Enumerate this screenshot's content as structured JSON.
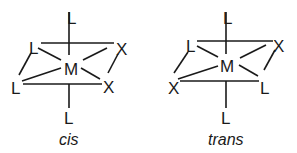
{
  "diagram": {
    "isomers": [
      {
        "id": "cis",
        "caption": "cis",
        "metal": "M",
        "ligands": {
          "axial_top": "L",
          "axial_bottom": "L",
          "back_left": "L",
          "back_right": "X",
          "front_left": "L",
          "front_right": "X"
        }
      },
      {
        "id": "trans",
        "caption": "trans",
        "metal": "M",
        "ligands": {
          "axial_top": "L",
          "axial_bottom": "L",
          "back_left": "L",
          "back_right": "X",
          "front_left": "X",
          "front_right": "L"
        }
      }
    ],
    "colors": {
      "ink": "#1a1a1a",
      "background": "#ffffff"
    }
  }
}
